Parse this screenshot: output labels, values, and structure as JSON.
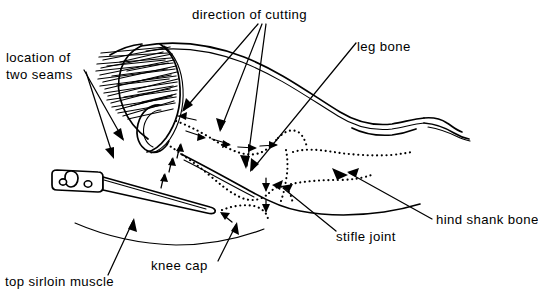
{
  "figure": {
    "type": "line-drawing",
    "background_color": "#ffffff",
    "ink_color": "#000000"
  },
  "labels": {
    "direction_of_cutting": "direction of cutting",
    "leg_bone": "leg bone",
    "location_of_two_seams_line1": "location of",
    "location_of_two_seams_line2": "two seams",
    "hind_shank_bone": "hind shank bone",
    "stifle_joint": "stifle joint",
    "knee_cap": "knee cap",
    "top_sirloin_muscle": "top sirloin muscle"
  },
  "callouts": [
    {
      "name": "direction-of-cutting",
      "text": "direction of cutting",
      "x": 192,
      "y": 15,
      "anchor": "start",
      "leaders": 3
    },
    {
      "name": "leg-bone",
      "text": "leg bone",
      "x": 356,
      "y": 47,
      "anchor": "start",
      "leaders": 1
    },
    {
      "name": "location-of-two-seams",
      "text": "location of / two seams",
      "x": 6,
      "y": 60,
      "anchor": "start",
      "leaders": 2
    },
    {
      "name": "hind-shank-bone",
      "text": "hind shank bone",
      "x": 434,
      "y": 226,
      "anchor": "start",
      "leaders": 1
    },
    {
      "name": "stifle-joint",
      "text": "stifle joint",
      "x": 334,
      "y": 242,
      "anchor": "start",
      "leaders": 1
    },
    {
      "name": "knee-cap",
      "text": "knee cap",
      "x": 150,
      "y": 270,
      "anchor": "start",
      "leaders": 1
    },
    {
      "name": "top-sirloin-muscle",
      "text": "top sirloin muscle",
      "x": 4,
      "y": 285,
      "anchor": "start",
      "leaders": 1
    }
  ],
  "elements": {
    "knife": "boning knife with riveted handle",
    "aitch_bone": "hatched pelvic / aitch bone region",
    "seam_paths": "dotted cutting seam lines",
    "cut_arrows": "small solid arrowheads indicating cut direction"
  }
}
